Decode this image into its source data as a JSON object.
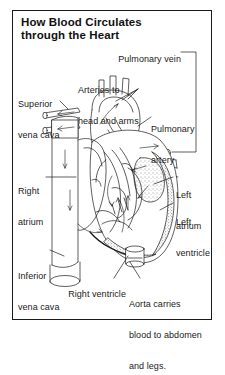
{
  "figure": {
    "title": "How Blood Circulates\nthrough the Heart",
    "title_line1": "How Blood Circulates",
    "title_line2": "through the Heart",
    "style": "black-and-white line drawing with stippled muscle walls and flow arrows",
    "ink_color": "#1a1a1a",
    "background_color": "#ffffff",
    "frame_color": "#1a1a1a"
  },
  "labels": [
    {
      "id": "pulmonary-vein",
      "text": "Pulmonary vein",
      "x": 108,
      "y": 48
    },
    {
      "id": "arteries-head-arms",
      "text": "Arteries to\nhead and arms",
      "line1": "Arteries to",
      "line2": "head and arms",
      "x": 78,
      "y": 68
    },
    {
      "id": "superior-vena-cava",
      "text": "Superior\nvena cava",
      "line1": "Superior",
      "line2": "vena cava",
      "x": 18,
      "y": 80
    },
    {
      "id": "pulmonary-artery",
      "text": "Pulmonary\nartery",
      "line1": "Pulmonary",
      "line2": "artery",
      "x": 152,
      "y": 106
    },
    {
      "id": "right-atrium",
      "text": "Right\natrium",
      "line1": "Right",
      "line2": "atrium",
      "x": 18,
      "y": 166
    },
    {
      "id": "left-atrium",
      "text": "Left\natrium",
      "line1": "Left",
      "line2": "atrium",
      "x": 175,
      "y": 170
    },
    {
      "id": "left-ventricle",
      "text": "Left\nventricle",
      "line1": "Left",
      "line2": "ventricle",
      "x": 175,
      "y": 199
    },
    {
      "id": "inferior-vena-cava",
      "text": "Inferior\nvena cava",
      "line1": "Inferior",
      "line2": "vena cava",
      "x": 18,
      "y": 252
    },
    {
      "id": "right-ventricle",
      "text": "Right ventricle",
      "x": 58,
      "y": 281
    },
    {
      "id": "aorta",
      "text": "Aorta carries\nblood to abdomen\nand legs.",
      "line1": "Aorta carries",
      "line2": "blood to abdomen",
      "line3": "and legs.",
      "x": 129,
      "y": 281
    }
  ]
}
